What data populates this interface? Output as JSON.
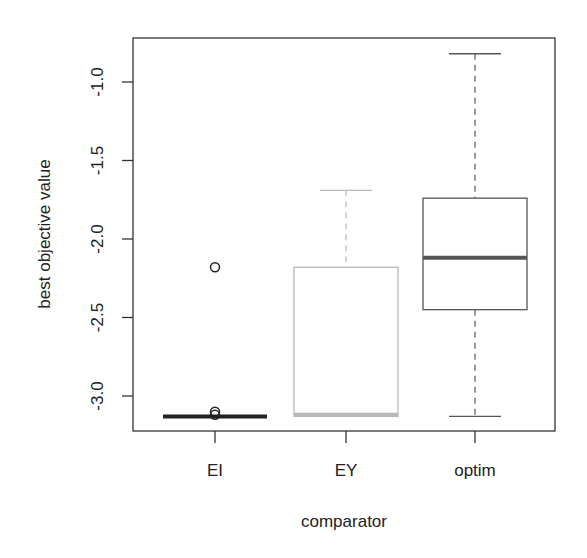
{
  "chart_data": {
    "type": "boxplot",
    "title": "",
    "xlabel": "comparator",
    "ylabel": "best objective value",
    "categories": [
      "EI",
      "EY",
      "optim"
    ],
    "yticks": [
      -1.0,
      -1.5,
      -2.0,
      -2.5,
      -3.0
    ],
    "ytick_labels": [
      "-1.0",
      "-1.5",
      "-2.0",
      "-2.5",
      "-3.0"
    ],
    "ylim": [
      -3.22,
      -0.72
    ],
    "grid": false,
    "legend": null,
    "series": [
      {
        "name": "EI",
        "color": "#222222",
        "whisker_low": -3.13,
        "q1": -3.13,
        "median": -3.13,
        "q3": -3.13,
        "whisker_high": -3.13,
        "outliers": [
          -2.18,
          -3.1,
          -3.12
        ]
      },
      {
        "name": "EY",
        "color": "#b8b8b8",
        "whisker_low": -3.13,
        "q1": -3.13,
        "median": -3.12,
        "q3": -2.18,
        "whisker_high": -1.69,
        "outliers": []
      },
      {
        "name": "optim",
        "color": "#555555",
        "whisker_low": -3.13,
        "q1": -2.45,
        "median": -2.12,
        "q3": -1.74,
        "whisker_high": -0.82,
        "outliers": []
      }
    ]
  }
}
